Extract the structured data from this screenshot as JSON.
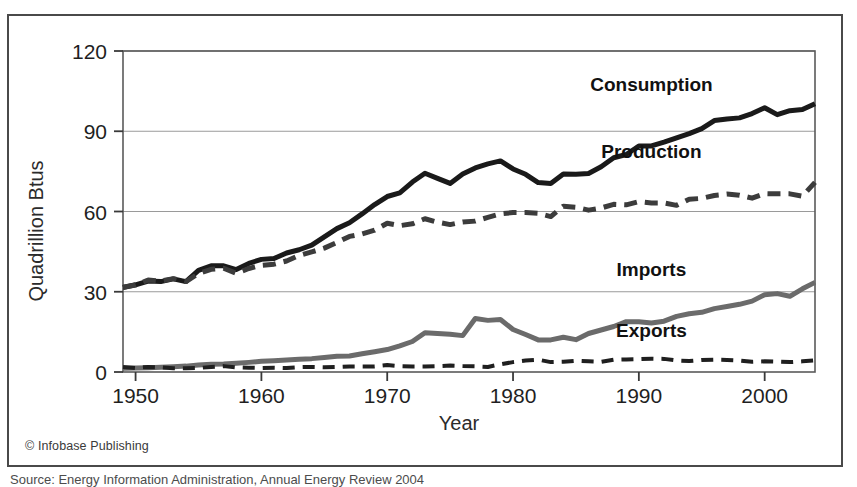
{
  "figure": {
    "credit": "© Infobase Publishing",
    "caption_partial": "Source: Energy Information Administration, Annual Energy Review 2004",
    "border_color": "#4a4a4a"
  },
  "chart_data": {
    "type": "line",
    "title": "",
    "xlabel": "Year",
    "ylabel": "Quadrillion Btus",
    "xlim": [
      1949,
      2004
    ],
    "ylim": [
      0,
      120
    ],
    "yticks": [
      0,
      30,
      60,
      90,
      120
    ],
    "xticks": [
      1950,
      1960,
      1970,
      1980,
      1990,
      2000
    ],
    "xtick_labels": [
      "1950",
      "1960",
      "1970",
      "1980",
      "1990",
      "2000"
    ],
    "ytick_labels": [
      "0",
      "30",
      "60",
      "90",
      "120"
    ],
    "grid": true,
    "grid_axis": "y",
    "legend": "inline-labels",
    "x": [
      1949,
      1950,
      1951,
      1952,
      1953,
      1954,
      1955,
      1956,
      1957,
      1958,
      1959,
      1960,
      1961,
      1962,
      1963,
      1964,
      1965,
      1966,
      1967,
      1968,
      1969,
      1970,
      1971,
      1972,
      1973,
      1974,
      1975,
      1976,
      1977,
      1978,
      1979,
      1980,
      1981,
      1982,
      1983,
      1984,
      1985,
      1986,
      1987,
      1988,
      1989,
      1990,
      1991,
      1992,
      1993,
      1994,
      1995,
      1996,
      1997,
      1998,
      1999,
      2000,
      2001,
      2002,
      2003,
      2004
    ],
    "series": [
      {
        "name": "Consumption",
        "color": "#1a1a1a",
        "style": "solid",
        "width": 5,
        "label_x": 1991,
        "label_y": 105,
        "values": [
          31.6,
          32.6,
          34.0,
          33.8,
          34.8,
          33.8,
          38.0,
          39.7,
          39.7,
          38.3,
          40.6,
          42.1,
          42.4,
          44.5,
          45.7,
          47.4,
          50.5,
          53.6,
          55.8,
          59.1,
          62.6,
          65.6,
          67.0,
          71.0,
          74.3,
          72.4,
          70.5,
          74.0,
          76.3,
          77.8,
          78.9,
          75.9,
          73.9,
          70.8,
          70.5,
          74.0,
          73.9,
          74.2,
          76.7,
          80.1,
          81.3,
          84.5,
          84.5,
          85.9,
          87.5,
          89.1,
          91.0,
          94.0,
          94.6,
          95.0,
          96.6,
          98.8,
          96.2,
          97.7,
          98.1,
          100.3
        ]
      },
      {
        "name": "Production",
        "color": "#3c3c3c",
        "style": "dashed",
        "width": 5,
        "label_x": 1991,
        "label_y": 80,
        "values": [
          31.7,
          32.5,
          34.4,
          34.0,
          34.9,
          33.8,
          36.8,
          38.4,
          38.8,
          36.9,
          38.7,
          39.9,
          40.3,
          41.5,
          43.6,
          44.9,
          46.3,
          48.4,
          50.7,
          51.6,
          53.0,
          55.6,
          54.7,
          55.4,
          57.3,
          56.0,
          55.1,
          56.1,
          56.4,
          57.8,
          59.1,
          59.6,
          59.6,
          59.3,
          58.1,
          62.0,
          61.6,
          60.5,
          61.3,
          62.7,
          62.5,
          63.7,
          63.2,
          63.2,
          62.3,
          64.6,
          64.9,
          66.0,
          66.5,
          66.1,
          65.0,
          66.7,
          66.6,
          66.6,
          65.7,
          70.9
        ]
      },
      {
        "name": "Imports",
        "color": "#6b6b6b",
        "style": "solid",
        "width": 5,
        "label_x": 1991,
        "label_y": 36,
        "values": [
          1.4,
          1.5,
          1.6,
          1.8,
          2.0,
          2.2,
          2.6,
          2.9,
          3.0,
          3.3,
          3.6,
          4.0,
          4.2,
          4.5,
          4.8,
          5.0,
          5.4,
          5.9,
          6.0,
          6.8,
          7.6,
          8.4,
          9.8,
          11.4,
          14.7,
          14.4,
          14.1,
          13.6,
          20.0,
          19.3,
          19.6,
          15.9,
          14.0,
          12.0,
          12.0,
          13.0,
          12.1,
          14.4,
          15.7,
          17.0,
          18.8,
          18.8,
          18.3,
          19.0,
          20.8,
          21.8,
          22.3,
          23.7,
          24.5,
          25.3,
          26.5,
          28.9,
          29.3,
          28.3,
          31.1,
          33.5
        ]
      },
      {
        "name": "Exports",
        "color": "#1f1f1f",
        "style": "dashed",
        "width": 4,
        "label_x": 1991,
        "label_y": 13,
        "values": [
          1.9,
          1.5,
          1.9,
          1.7,
          1.4,
          1.4,
          1.5,
          1.9,
          2.2,
          1.7,
          1.6,
          1.5,
          1.6,
          1.5,
          1.8,
          1.9,
          1.8,
          1.9,
          2.1,
          2.1,
          2.1,
          2.6,
          2.2,
          2.1,
          2.1,
          2.2,
          2.4,
          2.2,
          2.1,
          1.9,
          2.9,
          3.7,
          4.3,
          4.6,
          3.7,
          3.8,
          4.2,
          4.0,
          3.8,
          4.6,
          4.7,
          4.8,
          5.0,
          4.9,
          4.3,
          4.1,
          4.5,
          4.6,
          4.5,
          4.3,
          3.8,
          4.0,
          3.9,
          3.7,
          4.0,
          4.4
        ]
      }
    ]
  }
}
